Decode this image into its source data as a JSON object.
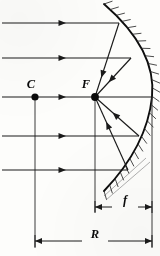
{
  "figure": {
    "background_color": "#fdfdfb",
    "ink_color": "#0a0a0a"
  },
  "labels": {
    "center_of_curvature": "C",
    "focal_point": "F",
    "focal_length": "f",
    "radius_of_curvature": "R"
  },
  "points": {
    "C": {
      "label": "C",
      "x": 35,
      "y": 97,
      "radius": 3.6,
      "label_x": 31,
      "label_y": 88
    },
    "F": {
      "label": "F",
      "x": 95,
      "y": 97,
      "radius": 3.9,
      "label_x": 86,
      "label_y": 88
    },
    "vertex": {
      "x": 152,
      "y": 97
    }
  },
  "mirror": {
    "name": "concave-mirror-arc",
    "path": "M 104 4 Q 157 50 152 97 Q 147 146 104 191",
    "hatch_side": "convex-back",
    "hatch_count": 26,
    "hatch_length": 9,
    "stroke_width": 1.9
  },
  "incoming_rays": [
    {
      "name": "ray-1",
      "y": 23,
      "x_start": 2,
      "x_end": 119,
      "arrow_x": 66
    },
    {
      "name": "ray-2",
      "y": 58,
      "x_start": 2,
      "x_end": 131,
      "arrow_x": 66
    },
    {
      "name": "ray-axis",
      "y": 97,
      "x_start": 2,
      "x_end": 152,
      "arrow_x": 66
    },
    {
      "name": "ray-4",
      "y": 136,
      "x_start": 2,
      "x_end": 139,
      "arrow_x": 66
    },
    {
      "name": "ray-5",
      "y": 170,
      "x_start": 2,
      "x_end": 128,
      "arrow_x": 66
    }
  ],
  "reflected_rays": [
    {
      "name": "reflected-ray-1",
      "from_x": 119,
      "from_y": 23,
      "to_x": 95,
      "to_y": 97,
      "arrow_t": 0.74
    },
    {
      "name": "reflected-ray-2",
      "from_x": 131,
      "from_y": 58,
      "to_x": 95,
      "to_y": 97,
      "arrow_t": 0.62
    },
    {
      "name": "reflected-ray-4",
      "from_x": 139,
      "from_y": 136,
      "to_x": 95,
      "to_y": 97,
      "arrow_t": 0.6
    },
    {
      "name": "reflected-ray-5",
      "from_x": 128,
      "from_y": 170,
      "to_x": 95,
      "to_y": 97,
      "arrow_t": 0.66
    }
  ],
  "guides": [
    {
      "name": "guide-line-C",
      "x": 35,
      "y_top": 97,
      "y_bottom": 248
    },
    {
      "name": "guide-line-F",
      "x": 95,
      "y_top": 97,
      "y_bottom": 212
    },
    {
      "name": "guide-line-vertex",
      "x": 152,
      "y_top": 97,
      "y_bottom": 248
    }
  ],
  "dimensions": [
    {
      "name": "focal-length-dimension",
      "symbol": "f",
      "y": 207,
      "x_start": 95,
      "x_end": 152,
      "label_x": 125,
      "label_y": 204
    },
    {
      "name": "radius-dimension",
      "symbol": "R",
      "y": 241,
      "x_start": 35,
      "x_end": 152,
      "label_x": 95,
      "label_y": 238
    }
  ]
}
